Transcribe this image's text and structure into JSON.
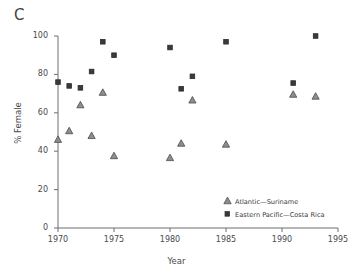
{
  "panel": {
    "letter": "C"
  },
  "chart_data": {
    "type": "scatter",
    "title": "",
    "xlabel": "Year",
    "ylabel": "% Female",
    "xlim": [
      1970,
      1995
    ],
    "ylim": [
      0,
      100
    ],
    "xticks": [
      1970,
      1975,
      1980,
      1985,
      1990,
      1995
    ],
    "xtick_labels": [
      "1970",
      "1975",
      "1980",
      "1985",
      "1990",
      "1995"
    ],
    "yticks": [
      0,
      20,
      40,
      60,
      80,
      100
    ],
    "ytick_labels": [
      "0",
      "20",
      "40",
      "60",
      "80",
      "100"
    ],
    "grid": false,
    "legend_position": "lower right",
    "series": [
      {
        "name": "Atlantic—Suriname",
        "marker": "triangle",
        "color": "#7a7a7a",
        "edge_color": "#4a4a4a",
        "x": [
          1970,
          1971,
          1972,
          1973,
          1974,
          1975,
          1980,
          1981,
          1982,
          1985,
          1991,
          1993
        ],
        "y": [
          46,
          50.5,
          64,
          48,
          70.5,
          37.5,
          36.5,
          44,
          66.5,
          43.5,
          69.5,
          68.5
        ]
      },
      {
        "name": "Eastern Pacific—Costa Rica",
        "marker": "square",
        "color": "#3a3a3a",
        "edge_color": "#2b2b2b",
        "x": [
          1970,
          1971,
          1972,
          1973,
          1974,
          1975,
          1980,
          1981,
          1982,
          1985,
          1991,
          1993
        ],
        "y": [
          76,
          74,
          73,
          81.5,
          97,
          90,
          94,
          72.5,
          79,
          97,
          75.5,
          100
        ]
      }
    ]
  },
  "legend": {
    "items": [
      {
        "label": "Atlantic—Suriname",
        "marker": "triangle"
      },
      {
        "label": "Eastern Pacific—Costa Rica",
        "marker": "square"
      }
    ]
  },
  "axes": {
    "axis_color": "#6e6e6e"
  }
}
